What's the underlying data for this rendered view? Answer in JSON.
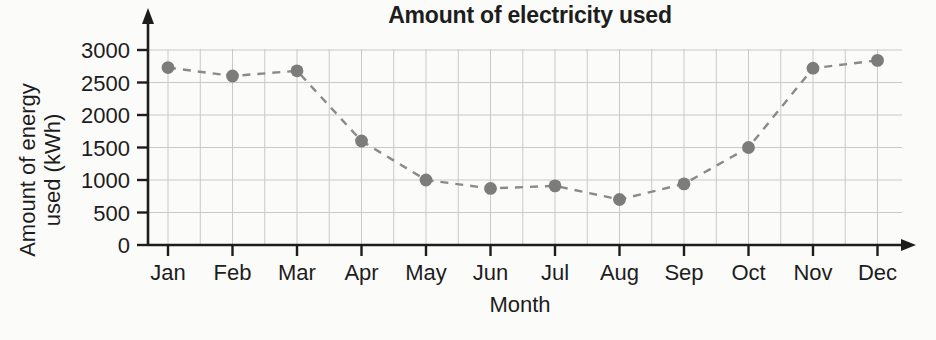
{
  "chart_data": {
    "type": "line",
    "title": "Amount of electricity used",
    "xlabel": "Month",
    "ylabel": "Amount of energy used (kWh)",
    "ylabel_lines": [
      "Amount of energy",
      "used (kWh)"
    ],
    "categories": [
      "Jan",
      "Feb",
      "Mar",
      "Apr",
      "May",
      "Jun",
      "Jul",
      "Aug",
      "Sep",
      "Oct",
      "Nov",
      "Dec"
    ],
    "values": [
      2730,
      2600,
      2680,
      1600,
      1000,
      870,
      910,
      700,
      940,
      1500,
      2720,
      2840
    ],
    "series": [
      {
        "name": "Amount of electricity used",
        "values": [
          2730,
          2600,
          2680,
          1600,
          1000,
          870,
          910,
          700,
          940,
          1500,
          2720,
          2840
        ]
      }
    ],
    "ylim": [
      0,
      3000
    ],
    "yticks": [
      0,
      500,
      1000,
      1500,
      2000,
      2500,
      3000
    ],
    "ytick_labels": [
      "0",
      "500",
      "1000",
      "1500",
      "2000",
      "2500",
      "3000"
    ],
    "xtick_labels": [
      "Jan",
      "Feb",
      "Mar",
      "Apr",
      "May",
      "Jun",
      "Jul",
      "Aug",
      "Sep",
      "Oct",
      "Nov",
      "Dec"
    ],
    "grid": true,
    "grid_minor_vertical": true,
    "legend": null,
    "legend_position": "none",
    "line_style": "dashed",
    "marker": "circle",
    "marker_color": "#7c7c7c",
    "line_color": "#8a8a8a",
    "grid_color": "#c9c9c9",
    "axis_color": "#1d1d1d",
    "annotations": []
  }
}
